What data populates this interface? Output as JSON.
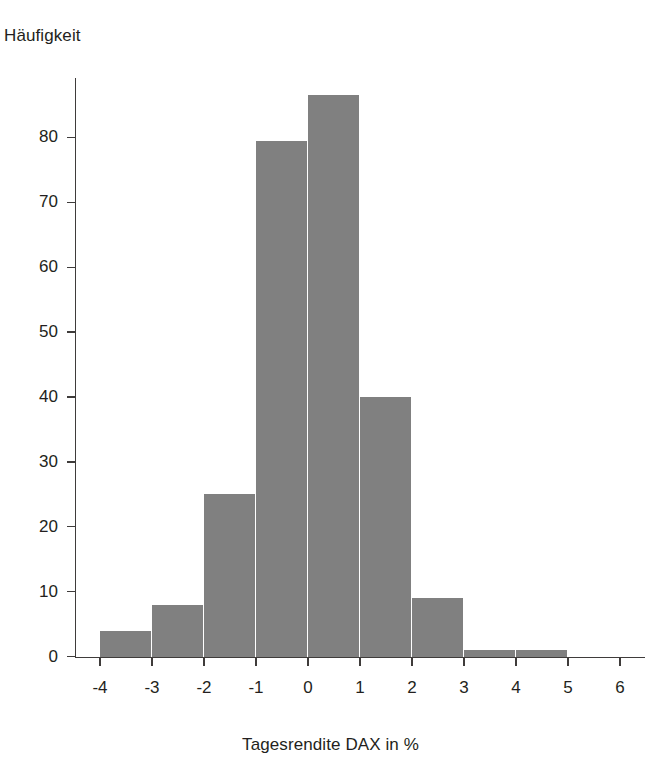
{
  "chart_data": {
    "type": "bar",
    "title": "",
    "xlabel": "Tagesrendite DAX in %",
    "ylabel": "Häufigkeit",
    "bin_width": 1,
    "bin_edges": [
      -4,
      -3,
      -2,
      -1,
      0,
      1,
      2,
      3,
      4,
      5
    ],
    "categories": [
      "-4 to -3",
      "-3 to -2",
      "-2 to -1",
      "-1 to 0",
      "0 to 1",
      "1 to 2",
      "2 to 3",
      "3 to 4",
      "4 to 5"
    ],
    "values": [
      4,
      8,
      25,
      79.5,
      86.5,
      40,
      9,
      1,
      1
    ],
    "xlim": [
      -4.6,
      6.9
    ],
    "ylim": [
      0,
      89
    ],
    "xticks": [
      -4,
      -3,
      -2,
      -1,
      0,
      1,
      2,
      3,
      4,
      5,
      6
    ],
    "xtick_labels": [
      "-4",
      "-3",
      "-2",
      "-1",
      "0",
      "1",
      "2",
      "3",
      "4",
      "5",
      "6"
    ],
    "yticks": [
      0,
      10,
      20,
      30,
      40,
      50,
      60,
      70,
      80
    ],
    "ytick_labels": [
      "0",
      "10",
      "20",
      "30",
      "40",
      "50",
      "60",
      "70",
      "80"
    ],
    "grid": false,
    "legend": false,
    "bar_color": "#808080",
    "axis_color": "#3f3c3b",
    "text_color": "#231f20",
    "background": "#ffffff"
  },
  "axes": {
    "y_axis_title": "Häufigkeit",
    "x_axis_title": "Tagesrendite DAX in %"
  }
}
